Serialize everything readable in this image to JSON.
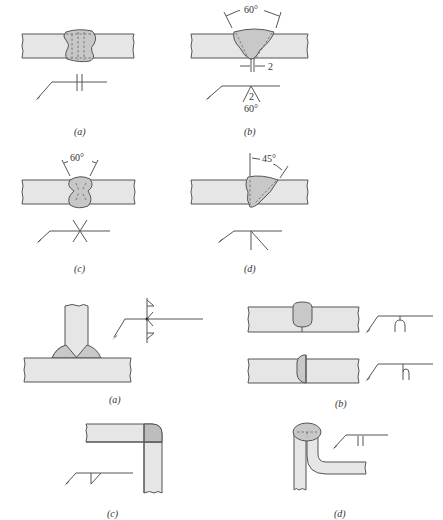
{
  "figure_1": {
    "panels": [
      {
        "id": "a",
        "caption": "(a)",
        "symbol": "square-groove-both-sides",
        "annotations": []
      },
      {
        "id": "b",
        "caption": "(b)",
        "symbol": "v-groove-arrow-side",
        "annotations": {
          "top_angle": "60°",
          "root_gap": "2",
          "symbol_root": "2",
          "symbol_angle": "60°"
        }
      },
      {
        "id": "c",
        "caption": "(c)",
        "symbol": "double-v-groove",
        "annotations": {
          "top_angle": "60°"
        }
      },
      {
        "id": "d",
        "caption": "(d)",
        "symbol": "bevel-groove",
        "annotations": {
          "top_angle": "45°"
        }
      }
    ]
  },
  "figure_2": {
    "panels": [
      {
        "id": "a",
        "caption": "(a)",
        "symbol": "fillet-weld-both-sides",
        "description": "T-joint with fillet welds"
      },
      {
        "id": "b",
        "caption": "(b)",
        "symbol": "flare-v-and-flare-bevel",
        "description": "Butt joints with flare welds"
      },
      {
        "id": "c",
        "caption": "(c)",
        "symbol": "fillet-weld-corner",
        "description": "Corner joint"
      },
      {
        "id": "d",
        "caption": "(d)",
        "symbol": "flare-groove",
        "description": "Bent plate edge joint"
      }
    ]
  },
  "colors": {
    "plate": "#e6e6e6",
    "weld": "#c8c8c8",
    "stroke": "#555555"
  }
}
